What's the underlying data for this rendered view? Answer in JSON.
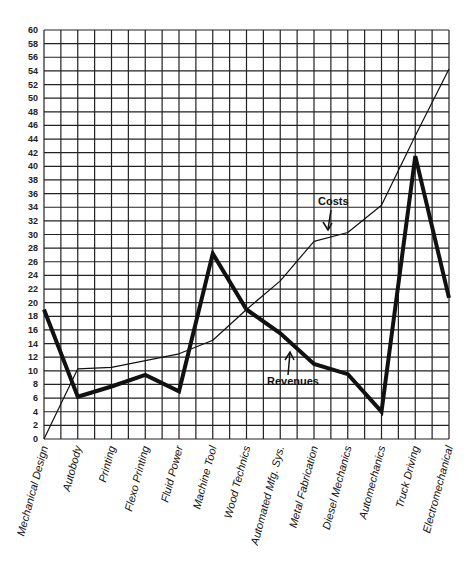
{
  "chart_data": {
    "type": "line",
    "title": "",
    "xlabel": "",
    "ylabel": "",
    "ylim": [
      0,
      60
    ],
    "ytick_step": 2,
    "grid": true,
    "legend": "inline annotations",
    "categories": [
      "Mechanical Design",
      "Autobody",
      "Printing",
      "Flexo Printing",
      "Fluid Power",
      "Machine Tool",
      "Wood Technics",
      "Automated Mfg. Sys.",
      "Metal Fabrication",
      "Diesel Mechanics",
      "Automechanics",
      "Truck Driving",
      "Electromechanical"
    ],
    "series": [
      {
        "name": "Costs",
        "style": "thin",
        "values": [
          0,
          10.3,
          10.5,
          11.5,
          12.5,
          14.5,
          19,
          23.2,
          29,
          30.3,
          34.3,
          44.5,
          54.3
        ]
      },
      {
        "name": "Revenues",
        "style": "thick",
        "values": [
          19,
          6.2,
          7.7,
          9.4,
          7,
          27.2,
          19,
          15.5,
          11,
          9.5,
          4,
          41.5,
          20.7
        ]
      }
    ],
    "annotations": [
      {
        "text": "Costs",
        "points_to_series": "Costs"
      },
      {
        "text": "Revenues",
        "points_to_series": "Revenues"
      }
    ]
  },
  "yticks": [
    "0",
    "2",
    "4",
    "6",
    "8",
    "10",
    "12",
    "14",
    "16",
    "18",
    "20",
    "22",
    "24",
    "26",
    "28",
    "30",
    "32",
    "34",
    "36",
    "38",
    "40",
    "42",
    "44",
    "46",
    "48",
    "50",
    "52",
    "54",
    "56",
    "58",
    "60"
  ]
}
